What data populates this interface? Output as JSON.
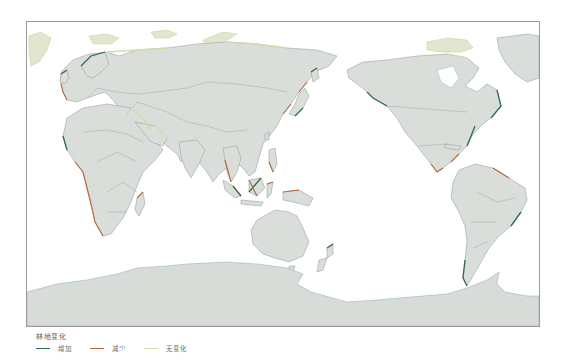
{
  "map": {
    "title": "林地变化 world map",
    "projection": "Pacific-centered world",
    "colors": {
      "land": "#dadedb",
      "increase": "#2f6b4c",
      "decrease": "#b8673a",
      "no_change": "#cfe0a6",
      "frame": "#9a9a9a"
    }
  },
  "legend": {
    "title": "林地变化",
    "items": [
      {
        "label": "增加",
        "color": "#2f6b4c",
        "meaning": "increase"
      },
      {
        "label": "减少",
        "color": "#b8673a",
        "meaning": "decrease"
      },
      {
        "label": "无变化",
        "color": "#cfe0a6",
        "meaning": "no change"
      }
    ]
  }
}
